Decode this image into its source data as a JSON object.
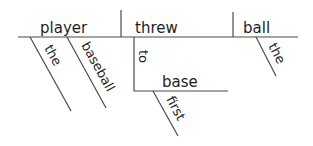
{
  "diagram": {
    "type": "sentence-diagram",
    "sentence_parts": {
      "subject": "player",
      "verb": "threw",
      "direct_object": "ball",
      "subject_modifiers": [
        "the",
        "baseball"
      ],
      "object_modifiers": [
        "the"
      ],
      "prepositional_phrase": {
        "preposition": "to",
        "object": "base",
        "object_modifiers": [
          "first"
        ]
      }
    },
    "labels": {
      "subject": "player",
      "verb": "threw",
      "object": "ball",
      "subj_mod_1": "the",
      "subj_mod_2": "baseball",
      "obj_mod_1": "the",
      "preposition": "to",
      "prep_object": "base",
      "prep_obj_mod": "first"
    },
    "line_color": "#4a4a4a",
    "text_color": "#1e1e1e"
  }
}
